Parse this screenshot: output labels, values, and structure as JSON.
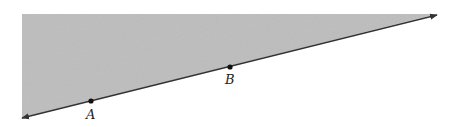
{
  "diagram": {
    "type": "half-plane",
    "shade_color": "#bdbdbd",
    "line_color": "#333333",
    "points": [
      {
        "label": "A",
        "x": 91,
        "y": 101
      },
      {
        "label": "B",
        "x": 230,
        "y": 67
      }
    ],
    "line": {
      "x1": 22,
      "y1": 118,
      "x2": 437,
      "y2": 15
    }
  }
}
